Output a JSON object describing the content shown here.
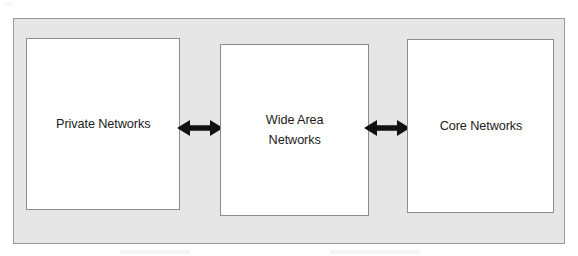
{
  "diagram": {
    "type": "block-diagram",
    "orientation": "horizontal",
    "background_color": "#ffffff",
    "panel": {
      "name": "outer-panel",
      "fill_color": "#e6e6e6",
      "border_color": "#9a9a9a"
    },
    "nodes": [
      {
        "id": "private-networks",
        "label": "Private Networks",
        "lines": [
          "Private Networks"
        ],
        "fill_color": "#ffffff",
        "border_color": "#8c8c8c",
        "text_color": "#1c1c1c",
        "order": 1
      },
      {
        "id": "wide-area-networks",
        "label": "Wide Area Networks",
        "lines": [
          "Wide Area",
          "Networks"
        ],
        "fill_color": "#ffffff",
        "border_color": "#8c8c8c",
        "text_color": "#1c1c1c",
        "order": 2
      },
      {
        "id": "core-networks",
        "label": "Core Networks",
        "lines": [
          "Core Networks"
        ],
        "fill_color": "#ffffff",
        "border_color": "#8c8c8c",
        "text_color": "#1c1c1c",
        "order": 3
      }
    ],
    "connectors": [
      {
        "id": "private-wan",
        "from": "private-networks",
        "to": "wide-area-networks",
        "style": "double-headed-arrow",
        "color": "#111111",
        "label": ""
      },
      {
        "id": "wan-core",
        "from": "wide-area-networks",
        "to": "core-networks",
        "style": "double-headed-arrow",
        "color": "#111111",
        "label": ""
      }
    ]
  }
}
